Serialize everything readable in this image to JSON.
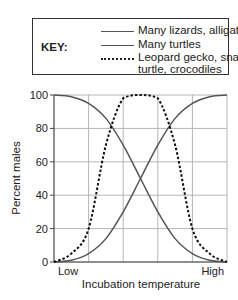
{
  "legend": {
    "key_label": "KEY:",
    "entries": [
      {
        "label": "Many lizards, alligators",
        "style": "solid"
      },
      {
        "label": "Many turtles",
        "style": "solid"
      },
      {
        "label": "Leopard gecko, snapping",
        "label_line2": "turtle, crocodiles",
        "style": "dashed"
      }
    ]
  },
  "chart_data": {
    "type": "line",
    "title": "",
    "xlabel": "Incubation temperature",
    "ylabel": "Percent males",
    "x_tick_labels": {
      "left": "Low",
      "right": "High"
    },
    "y_ticks": [
      0,
      20,
      40,
      60,
      80,
      100
    ],
    "ylim": [
      0,
      100
    ],
    "x": [
      0,
      0.1,
      0.2,
      0.3,
      0.4,
      0.5,
      0.6,
      0.7,
      0.8,
      0.9,
      1.0
    ],
    "xlim": [
      0,
      1
    ],
    "grid": true,
    "vertical_gridlines": 4,
    "legend_position": "top (boxed, above plot)",
    "series": [
      {
        "name": "Many lizards, alligators",
        "style": "solid",
        "color": "#555555",
        "values": [
          100,
          99,
          95,
          86,
          70,
          50,
          30,
          14,
          5,
          1,
          0
        ]
      },
      {
        "name": "Many turtles",
        "style": "solid",
        "color": "#555555",
        "values": [
          0,
          1,
          5,
          14,
          30,
          50,
          70,
          86,
          95,
          99,
          100
        ]
      },
      {
        "name": "Leopard gecko, snapping turtle, crocodiles",
        "style": "dashed",
        "color": "#111111",
        "values": [
          0,
          5,
          20,
          70,
          98,
          100,
          98,
          70,
          20,
          5,
          0
        ]
      }
    ]
  }
}
